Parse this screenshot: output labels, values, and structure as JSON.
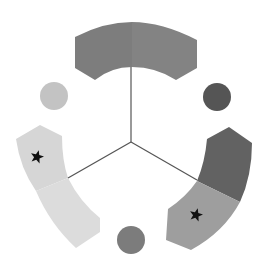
{
  "diagram": {
    "type": "radial-three-arm",
    "canvas": {
      "width": 271,
      "height": 270,
      "background": "#ffffff"
    },
    "center": {
      "x": 131,
      "y": 142
    },
    "spokes": [
      {
        "name": "spoke-top",
        "x2": 131,
        "y2": 67,
        "color": "#555555"
      },
      {
        "name": "spoke-left",
        "x2": 68,
        "y2": 178,
        "color": "#555555"
      },
      {
        "name": "spoke-right",
        "x2": 197,
        "y2": 180,
        "color": "#555555"
      }
    ],
    "arms": [
      {
        "name": "top-arm",
        "segments": [
          {
            "name": "top-arm-left-half",
            "color": "#7d7d7d",
            "path": "M75,37 Q104,22 132,22 L132,67 Q111,67 95,80 L75,68 Z",
            "star": false
          },
          {
            "name": "top-arm-right-half",
            "color": "#838383",
            "path": "M132,22 Q162,22 197,40 L197,68 L176,80 Q156,67 132,67 Z",
            "star": false
          }
        ]
      },
      {
        "name": "left-arm",
        "segments": [
          {
            "name": "left-arm-upper-segment",
            "color": "#d6d6d6",
            "path": "M40,125 L62,136 Q62,160 68,178 L36,191 Q20,168 16,139 Z",
            "star": true,
            "star_center": {
              "x": 37,
              "y": 157
            }
          },
          {
            "name": "left-arm-lower-segment",
            "color": "#dcdcdc",
            "path": "M36,191 L68,178 Q80,202 100,218 L100,232 L76,248 Q50,224 36,191 Z",
            "star": false
          }
        ]
      },
      {
        "name": "right-arm",
        "segments": [
          {
            "name": "right-arm-upper-segment",
            "color": "#626262",
            "path": "M207,139 L229,127 L252,143 Q252,176 240,202 L197,181 Q205,162 207,139 Z",
            "star": false
          },
          {
            "name": "right-arm-lower-segment",
            "color": "#9e9e9e",
            "path": "M197,181 L240,202 Q224,232 191,250 L166,240 L168,209 Q186,197 197,181 Z",
            "star": true,
            "star_center": {
              "x": 196,
              "y": 215
            }
          }
        ]
      }
    ],
    "circles": [
      {
        "name": "circle-upper-left",
        "cx": 54,
        "cy": 96,
        "r": 14,
        "color": "#c3c3c3"
      },
      {
        "name": "circle-upper-right",
        "cx": 217,
        "cy": 97,
        "r": 14,
        "color": "#555555"
      },
      {
        "name": "circle-bottom",
        "cx": 131,
        "cy": 240,
        "r": 14,
        "color": "#7c7c7c"
      }
    ],
    "star_color": "#111111",
    "star_size": 14
  }
}
